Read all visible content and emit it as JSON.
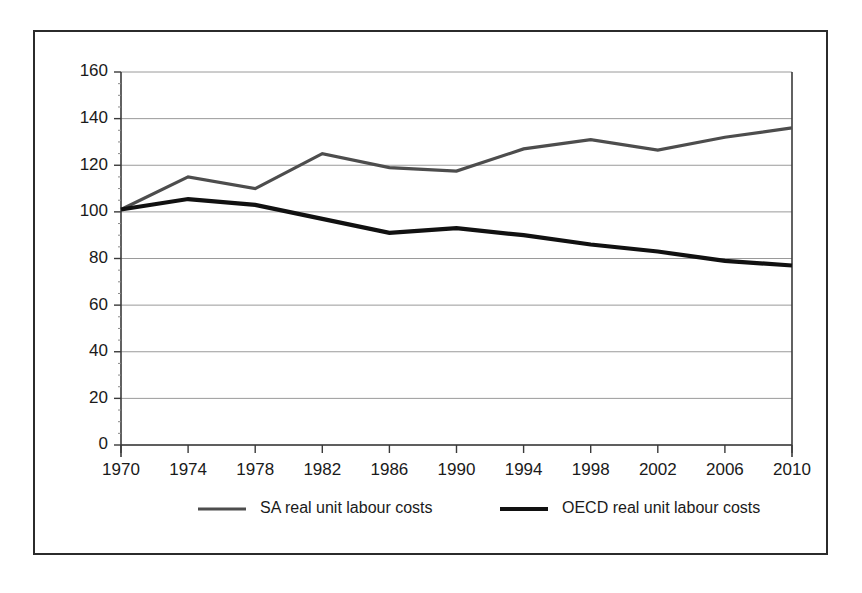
{
  "chart_data": {
    "type": "line",
    "title": "",
    "subtitle": "",
    "xlabel": "",
    "ylabel": "",
    "x": [
      1970,
      1974,
      1978,
      1982,
      1986,
      1990,
      1994,
      1998,
      2002,
      2006,
      2010
    ],
    "xtick_labels": [
      "1970",
      "1974",
      "1978",
      "1982",
      "1986",
      "1990",
      "1994",
      "1998",
      "2002",
      "2006",
      "2010"
    ],
    "ytick_labels": [
      "0",
      "20",
      "40",
      "60",
      "80",
      "100",
      "120",
      "140",
      "160"
    ],
    "yticks": [
      0,
      20,
      40,
      60,
      80,
      100,
      120,
      140,
      160
    ],
    "ylim": [
      0,
      160
    ],
    "xlim": [
      1970,
      2010
    ],
    "grid": true,
    "grid_axis": "y",
    "legend_position": "bottom",
    "series": [
      {
        "name": "SA real unit labour costs",
        "color": "#4d4d4d",
        "width": 3.2,
        "values": [
          101,
          115,
          110,
          125,
          119,
          117.5,
          127,
          131,
          126.5,
          132,
          136
        ]
      },
      {
        "name": "OECD real unit labour costs",
        "color": "#111111",
        "width": 4.2,
        "values": [
          101,
          105.5,
          103,
          97,
          91,
          93,
          90,
          86,
          83,
          79,
          77
        ]
      }
    ]
  },
  "legend": {
    "items": [
      {
        "label": "SA real unit labour costs",
        "swatch_color": "#4d4d4d"
      },
      {
        "label": "OECD real unit labour costs",
        "swatch_color": "#111111"
      }
    ]
  },
  "colors": {
    "frame_border": "#2b2b2b",
    "gridline": "#9a9a9a",
    "axis": "#3a3a3a",
    "text": "#1a1a1a",
    "background": "#ffffff"
  }
}
